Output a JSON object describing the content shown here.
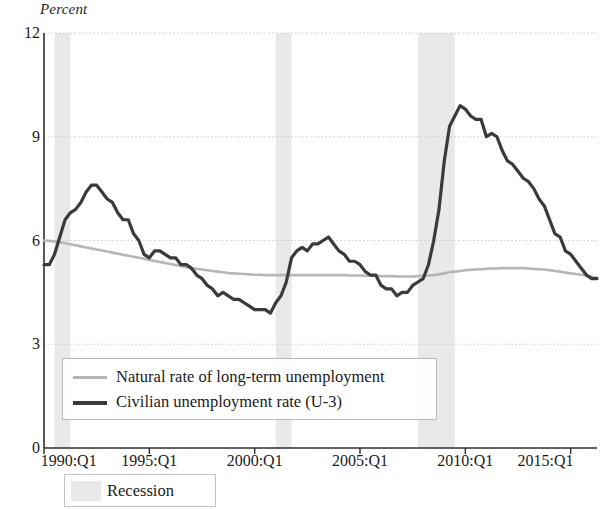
{
  "chart_data": {
    "type": "line",
    "title": "",
    "ylabel": "Percent",
    "xlabel": "",
    "ylim": [
      0,
      12
    ],
    "yticks": [
      0,
      3,
      6,
      9,
      12
    ],
    "xticks": [
      "1990:Q1",
      "1995:Q1",
      "2000:Q1",
      "2005:Q1",
      "2010:Q1",
      "2015:Q1"
    ],
    "xtick_values": [
      1990.0,
      1995.0,
      2000.0,
      2005.0,
      2010.0,
      2015.0
    ],
    "xlim": [
      1990.0,
      2016.25
    ],
    "grid": "horizontal-dotted",
    "legend_position": "inside-lower-left",
    "x": [
      1990.0,
      1990.25,
      1990.5,
      1990.75,
      1991.0,
      1991.25,
      1991.5,
      1991.75,
      1992.0,
      1992.25,
      1992.5,
      1992.75,
      1993.0,
      1993.25,
      1993.5,
      1993.75,
      1994.0,
      1994.25,
      1994.5,
      1994.75,
      1995.0,
      1995.25,
      1995.5,
      1995.75,
      1996.0,
      1996.25,
      1996.5,
      1996.75,
      1997.0,
      1997.25,
      1997.5,
      1997.75,
      1998.0,
      1998.25,
      1998.5,
      1998.75,
      1999.0,
      1999.25,
      1999.5,
      1999.75,
      2000.0,
      2000.25,
      2000.5,
      2000.75,
      2001.0,
      2001.25,
      2001.5,
      2001.75,
      2002.0,
      2002.25,
      2002.5,
      2002.75,
      2003.0,
      2003.25,
      2003.5,
      2003.75,
      2004.0,
      2004.25,
      2004.5,
      2004.75,
      2005.0,
      2005.25,
      2005.5,
      2005.75,
      2006.0,
      2006.25,
      2006.5,
      2006.75,
      2007.0,
      2007.25,
      2007.5,
      2007.75,
      2008.0,
      2008.25,
      2008.5,
      2008.75,
      2009.0,
      2009.25,
      2009.5,
      2009.75,
      2010.0,
      2010.25,
      2010.5,
      2010.75,
      2011.0,
      2011.25,
      2011.5,
      2011.75,
      2012.0,
      2012.25,
      2012.5,
      2012.75,
      2013.0,
      2013.25,
      2013.5,
      2013.75,
      2014.0,
      2014.25,
      2014.5,
      2014.75,
      2015.0,
      2015.25,
      2015.5,
      2015.75,
      2016.0,
      2016.25
    ],
    "series": [
      {
        "name": "Civilian unemployment rate (U-3)",
        "color": "#3a3a3a",
        "linewidth": 3.2,
        "values": [
          5.3,
          5.3,
          5.6,
          6.1,
          6.6,
          6.8,
          6.9,
          7.1,
          7.4,
          7.6,
          7.6,
          7.4,
          7.2,
          7.1,
          6.8,
          6.6,
          6.6,
          6.2,
          6.0,
          5.6,
          5.5,
          5.7,
          5.7,
          5.6,
          5.5,
          5.5,
          5.3,
          5.3,
          5.2,
          5.0,
          4.9,
          4.7,
          4.6,
          4.4,
          4.5,
          4.4,
          4.3,
          4.3,
          4.2,
          4.1,
          4.0,
          4.0,
          4.0,
          3.9,
          4.2,
          4.4,
          4.8,
          5.5,
          5.7,
          5.8,
          5.7,
          5.9,
          5.9,
          6.0,
          6.1,
          5.9,
          5.7,
          5.6,
          5.4,
          5.4,
          5.3,
          5.1,
          5.0,
          5.0,
          4.7,
          4.6,
          4.6,
          4.4,
          4.5,
          4.5,
          4.7,
          4.8,
          4.9,
          5.3,
          6.0,
          6.9,
          8.3,
          9.3,
          9.6,
          9.9,
          9.8,
          9.6,
          9.5,
          9.5,
          9.0,
          9.1,
          9.0,
          8.6,
          8.3,
          8.2,
          8.0,
          7.8,
          7.7,
          7.5,
          7.2,
          7.0,
          6.6,
          6.2,
          6.1,
          5.7,
          5.6,
          5.4,
          5.2,
          5.0,
          4.9,
          4.9
        ]
      },
      {
        "name": "Natural rate of long-term unemployment",
        "color": "#b6b6b6",
        "linewidth": 2.6,
        "values": [
          6.0,
          5.99,
          5.97,
          5.95,
          5.92,
          5.89,
          5.86,
          5.83,
          5.8,
          5.77,
          5.74,
          5.71,
          5.68,
          5.65,
          5.62,
          5.59,
          5.56,
          5.53,
          5.5,
          5.47,
          5.44,
          5.41,
          5.38,
          5.35,
          5.32,
          5.29,
          5.26,
          5.23,
          5.2,
          5.18,
          5.16,
          5.14,
          5.12,
          5.1,
          5.08,
          5.06,
          5.05,
          5.04,
          5.03,
          5.02,
          5.01,
          5.01,
          5.0,
          5.0,
          5.0,
          5.0,
          5.0,
          5.0,
          5.0,
          5.0,
          5.0,
          5.0,
          5.0,
          5.0,
          5.0,
          5.0,
          5.0,
          5.0,
          4.99,
          4.99,
          4.99,
          4.98,
          4.98,
          4.98,
          4.97,
          4.97,
          4.97,
          4.96,
          4.96,
          4.96,
          4.96,
          4.97,
          4.98,
          4.99,
          5.0,
          5.02,
          5.05,
          5.08,
          5.1,
          5.12,
          5.14,
          5.15,
          5.16,
          5.17,
          5.18,
          5.19,
          5.19,
          5.2,
          5.2,
          5.2,
          5.2,
          5.2,
          5.19,
          5.18,
          5.17,
          5.16,
          5.14,
          5.12,
          5.1,
          5.07,
          5.05,
          5.03,
          5.01,
          4.98,
          4.95,
          4.92
        ]
      }
    ],
    "recessions": [
      {
        "start": 1990.5,
        "end": 1991.25
      },
      {
        "start": 2001.0,
        "end": 2001.75
      },
      {
        "start": 2007.75,
        "end": 2009.5
      }
    ],
    "recession_color": "#e9e9e9"
  },
  "legend": {
    "natural_label": "Natural rate of long-term unemployment",
    "civilian_label": "Civilian unemployment rate (U-3)",
    "recession_label": "Recession"
  }
}
